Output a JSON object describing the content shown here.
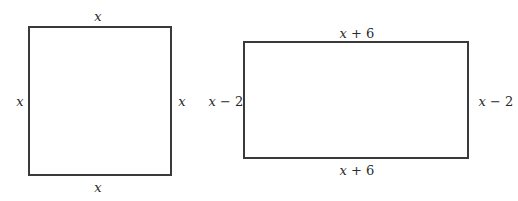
{
  "figures": [
    {
      "name": "square",
      "shape": "square",
      "labels": {
        "top": "x",
        "bottom": "x",
        "left": "x",
        "right": "x"
      }
    },
    {
      "name": "rectangle",
      "shape": "rectangle",
      "labels": {
        "top": "x + 6",
        "bottom": "x + 6",
        "left": "x − 2",
        "right": "x − 2"
      }
    }
  ],
  "colors": {
    "stroke": "#3a3a3a",
    "text": "#2a2a2a",
    "background": "#ffffff"
  }
}
